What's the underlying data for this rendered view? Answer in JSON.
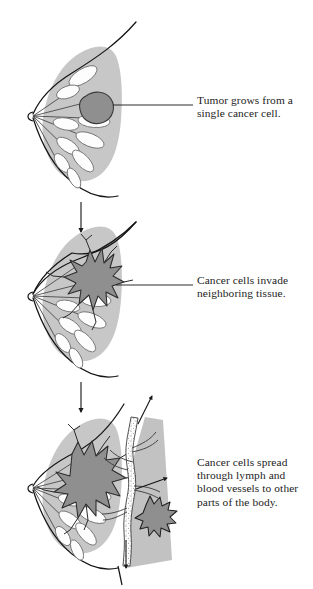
{
  "figure": {
    "background_color": "#ffffff",
    "ink_color": "#1a1a1a",
    "tissue_gray": "#c7c7c7",
    "tumor_gray": "#8f8f8f",
    "chestwall_gray": "#c2c2c2",
    "lobule_white": "#fdfdfd"
  },
  "panels": [
    {
      "id": "panel-1",
      "stage_number": "1",
      "caption": "Tumor grows from a\nsingle cancer cell.",
      "tumor_description": "round-smooth-tumor",
      "has_leader_line": true
    },
    {
      "id": "panel-2",
      "stage_number": "2",
      "caption": "Cancer cells invade\nneighboring tissue.",
      "tumor_description": "spiculated-invasive-tumor",
      "has_leader_line": true
    },
    {
      "id": "panel-3",
      "stage_number": "3",
      "caption": "Cancer cells spread\nthrough lymph and\nblood vessels to other\nparts of the body.",
      "tumor_description": "metastatic-tumor-with-vessels",
      "has_leader_line": false
    }
  ],
  "arrows": {
    "flow_1_label": "downward-progression-arrow",
    "flow_2_label": "downward-progression-arrow",
    "vessel_up_label": "vessel-flow-arrow-up",
    "vessel_down_label": "vessel-flow-arrow-down",
    "vessel_branch_label": "vessel-branch-arrow"
  }
}
